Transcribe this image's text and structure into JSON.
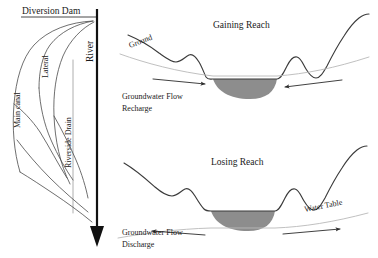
{
  "figure": {
    "title": "",
    "left_panel": {
      "name": "irrigation-canal-network",
      "labels": {
        "diversion_dam": "Diversion Dam",
        "river": "River",
        "main_canal": "Main canal",
        "lateral": "Lateral",
        "riverside_drain": "Riverside Drain"
      }
    },
    "right_panels": [
      {
        "name": "gaining-reach",
        "title": "Gaining Reach",
        "ground_label": "Ground",
        "flow_label_line1": "Groundwater Flow",
        "flow_label_line2": "Recharge",
        "water_table_label": "",
        "left_arrow_direction": "right",
        "right_arrow_direction": "left",
        "water_table_position": "above-channel-bottom"
      },
      {
        "name": "losing-reach",
        "title": "Losing Reach",
        "ground_label": "",
        "flow_label_line1": "Groundwater Flow",
        "flow_label_line2": "Discharge",
        "water_table_label": "Water Table",
        "left_arrow_direction": "left",
        "right_arrow_direction": "right",
        "water_table_position": "below-channel-bottom"
      }
    ],
    "colors": {
      "channel_fill": "#8d8d8d",
      "ground_stroke": "#3b3b3b",
      "water_table_stroke": "#b9b9b9",
      "river_stroke": "#111111",
      "canal_stroke": "#4a4a4a",
      "background": "#ffffff"
    }
  }
}
